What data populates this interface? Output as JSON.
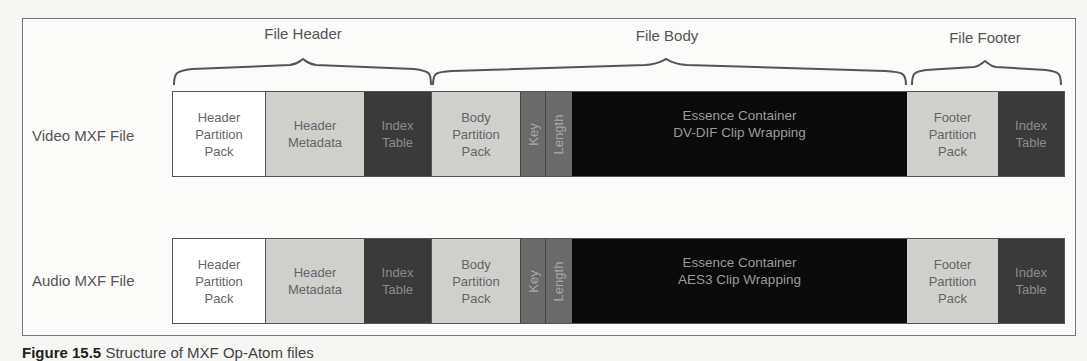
{
  "sections": [
    {
      "label": "File Header",
      "center_x": 303
    },
    {
      "label": "File Body",
      "center_x": 667
    },
    {
      "label": "File Footer",
      "center_x": 985
    }
  ],
  "rows": [
    {
      "label": "Video MXF File",
      "blocks": [
        {
          "text": "Header\nPartition\nPack",
          "shade": "white"
        },
        {
          "text": "Header\nMetadata",
          "shade": "light"
        },
        {
          "text": "Index\nTable",
          "shade": "dark"
        },
        {
          "text": "Body\nPartition\nPack",
          "shade": "light"
        },
        {
          "text": "Key",
          "shade": "medium",
          "vertical": true
        },
        {
          "text": "Length",
          "shade": "medium",
          "vertical": true
        },
        {
          "text": "Essence Container\nDV-DIF Clip Wrapping",
          "shade": "black"
        },
        {
          "text": "Footer\nPartition\nPack",
          "shade": "light"
        },
        {
          "text": "Index\nTable",
          "shade": "dark"
        }
      ]
    },
    {
      "label": "Audio MXF File",
      "blocks": [
        {
          "text": "Header\nPartition\nPack",
          "shade": "white"
        },
        {
          "text": "Header\nMetadata",
          "shade": "light"
        },
        {
          "text": "Index\nTable",
          "shade": "dark"
        },
        {
          "text": "Body\nPartition\nPack",
          "shade": "light"
        },
        {
          "text": "Key",
          "shade": "medium",
          "vertical": true
        },
        {
          "text": "Length",
          "shade": "medium",
          "vertical": true
        },
        {
          "text": "Essence Container\nAES3 Clip Wrapping",
          "shade": "black"
        },
        {
          "text": "Footer\nPartition\nPack",
          "shade": "light"
        },
        {
          "text": "Index\nTable",
          "shade": "dark"
        }
      ]
    }
  ],
  "caption": {
    "prefix": "Figure 15.5",
    "text": "Structure of MXF Op-Atom files"
  }
}
